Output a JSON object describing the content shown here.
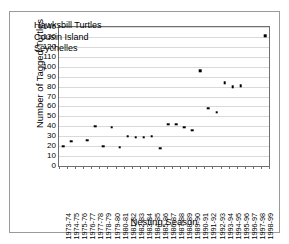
{
  "chart_data": {
    "type": "scatter",
    "title": "",
    "annotation": [
      "Hawksbill Turtles",
      "Cousin Island",
      "Seychelles"
    ],
    "xlabel": "Nesting Season",
    "ylabel": "Number of Tagged Turtles",
    "ylim": [
      0,
      140
    ],
    "ytick_step": 10,
    "yticks": [
      140,
      130,
      120,
      110,
      100,
      90,
      80,
      70,
      60,
      50,
      40,
      30,
      20,
      10,
      0
    ],
    "grid": true,
    "legend": "none",
    "marker": "square",
    "marker_color": "#000000",
    "categories": [
      "1973-74",
      "1974-75",
      "1975-76",
      "1976-77",
      "1977-78",
      "1978-79",
      "1979-80",
      "1980-81",
      "1981-82",
      "1982-83",
      "1983-84",
      "1984-85",
      "1985-86",
      "1986-87",
      "1987-88",
      "1988-89",
      "1989-90",
      "1990-91",
      "1991-92",
      "1992-93",
      "1993-94",
      "1994-95",
      "1995-96",
      "1996-97",
      "1997-98",
      "1998-99"
    ],
    "values": [
      20,
      25,
      null,
      26,
      40,
      20,
      39,
      19,
      30,
      29,
      29,
      30,
      18,
      42,
      42,
      39,
      36,
      96,
      58,
      54,
      84,
      80,
      81,
      null,
      null,
      131
    ]
  }
}
